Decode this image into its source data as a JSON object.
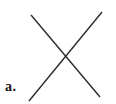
{
  "figure": {
    "label": "a.",
    "background_color": "#ffffff",
    "line_color": "#2b2b2b",
    "line_width": 1.4,
    "canvas": {
      "width": 116,
      "height": 104
    },
    "lines": [
      {
        "name": "diagonal-line-nw-se",
        "x1": 31,
        "y1": 15,
        "x2": 100,
        "y2": 97
      },
      {
        "name": "diagonal-line-sw-ne",
        "x1": 29,
        "y1": 101,
        "x2": 102,
        "y2": 12
      }
    ]
  }
}
